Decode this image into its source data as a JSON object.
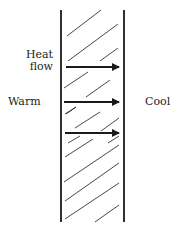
{
  "diagram": {
    "labels": {
      "heat_flow_line1": "Heat",
      "heat_flow_line2": "flow",
      "warm_side": "Warm",
      "cool_side": "Cool"
    },
    "wall": {
      "left_x": 61,
      "right_x": 124,
      "top_y": 10,
      "bottom_y": 222,
      "fill": "hatched"
    },
    "arrows": [
      {
        "x1": 66,
        "x2": 119,
        "y": 67,
        "direction": "right"
      },
      {
        "x1": 64,
        "x2": 119,
        "y": 102,
        "direction": "right"
      },
      {
        "x1": 65,
        "x2": 119,
        "y": 133,
        "direction": "right"
      }
    ],
    "colors": {
      "line": "#1a1a1a",
      "background": "#ffffff"
    }
  }
}
